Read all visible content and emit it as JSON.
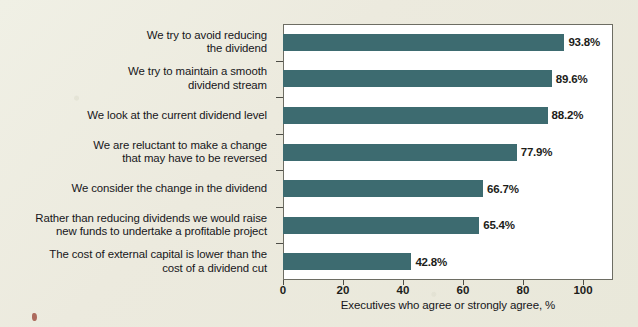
{
  "chart_data": {
    "type": "bar",
    "orientation": "horizontal",
    "title": "",
    "xlabel": "Executives who agree or strongly agree, %",
    "ylabel": "",
    "xlim": [
      0,
      110
    ],
    "xticks": [
      0,
      20,
      40,
      60,
      80,
      100
    ],
    "grid": false,
    "legend": "none",
    "bar_color": "#3d6b70",
    "plot_background": "#ffffff",
    "page_background": "#eceade",
    "categories": [
      "We try to avoid reducing\nthe dividend",
      "We try to maintain a smooth\ndividend stream",
      "We look at the current dividend level",
      "We are reluctant to make a change\nthat may have to be reversed",
      "We consider the change in the dividend",
      "Rather than reducing dividends we would raise\nnew funds to undertake a profitable project",
      "The cost of external capital is lower than the\ncost of a dividend cut"
    ],
    "values": [
      93.8,
      89.6,
      88.2,
      77.9,
      66.7,
      65.4,
      42.8
    ],
    "value_labels": [
      "93.8%",
      "89.6%",
      "88.2%",
      "77.9%",
      "66.7%",
      "65.4%",
      "42.8%"
    ],
    "bars": [
      {
        "label_line1": "We try to avoid reducing",
        "label_line2": "the dividend",
        "value": 93.8,
        "value_label": "93.8%"
      },
      {
        "label_line1": "We try to maintain a smooth",
        "label_line2": "dividend stream",
        "value": 89.6,
        "value_label": "89.6%"
      },
      {
        "label_line1": "We look at the current dividend level",
        "label_line2": "",
        "value": 88.2,
        "value_label": "88.2%"
      },
      {
        "label_line1": "We are reluctant to make a change",
        "label_line2": "that may have to be reversed",
        "value": 77.9,
        "value_label": "77.9%"
      },
      {
        "label_line1": "We consider the change in the dividend",
        "label_line2": "",
        "value": 66.7,
        "value_label": "66.7%"
      },
      {
        "label_line1": "Rather than reducing dividends we would raise",
        "label_line2": "new funds to undertake a profitable project",
        "value": 65.4,
        "value_label": "65.4%"
      },
      {
        "label_line1": "The cost of external capital is lower than the",
        "label_line2": "cost of a dividend cut",
        "value": 42.8,
        "value_label": "42.8%"
      }
    ],
    "xtick_labels": [
      "0",
      "20",
      "40",
      "60",
      "80",
      "100"
    ]
  }
}
